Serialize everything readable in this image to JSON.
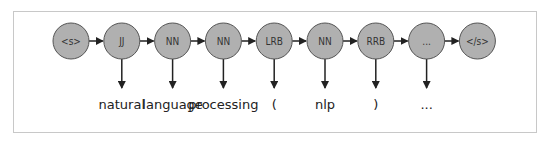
{
  "diagram": {
    "type": "hmm-pos-tagging",
    "colors": {
      "node_fill": "#b0b0b0",
      "node_stroke": "#555555",
      "arrow": "#222222",
      "frame": "#c8c8c8"
    },
    "nodes": [
      {
        "label": "<s>",
        "word": null
      },
      {
        "label": "JJ",
        "word": "natural"
      },
      {
        "label": "NN",
        "word": "language"
      },
      {
        "label": "NN",
        "word": "processing"
      },
      {
        "label": "LRB",
        "word": "("
      },
      {
        "label": "NN",
        "word": "nlp"
      },
      {
        "label": "RRB",
        "word": ")"
      },
      {
        "label": "...",
        "word": "..."
      },
      {
        "label": "</s>",
        "word": null
      }
    ]
  }
}
